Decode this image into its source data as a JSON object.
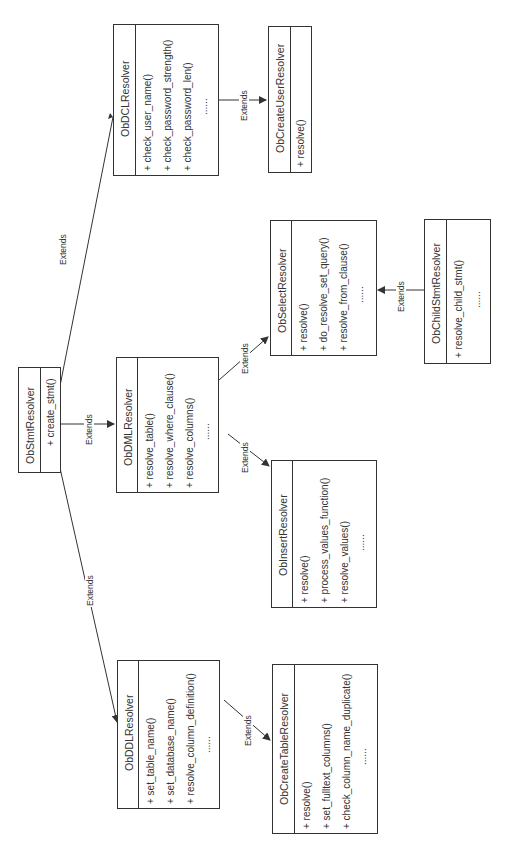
{
  "diagram": {
    "type": "uml-class-hierarchy",
    "orientation": "rotated-90-ccw",
    "edge_label": "Extends",
    "classes": {
      "stmt": {
        "name": "ObStmtResolver",
        "methods": [
          "+ create_stmt()"
        ]
      },
      "ddl": {
        "name": "ObDDLResolver",
        "methods": [
          "+ set_table_name()",
          "+ set_database_name()",
          "+ resolve_column_definition()",
          "......"
        ]
      },
      "dml": {
        "name": "ObDMLResolver",
        "methods": [
          "+ resolve_table()",
          "+ resolve_where_clause()",
          "+ resolve_columns()",
          "......"
        ]
      },
      "dcl": {
        "name": "ObDCLResolver",
        "methods": [
          "+ check_user_name()",
          "+ check_password_strength()",
          "+ check_password_len()",
          "......"
        ]
      },
      "create_table": {
        "name": "ObCreateTableResolver",
        "methods": [
          "+ resolve()",
          "+ set_fulltext_columns()",
          "+ check_column_name_duplicate()",
          "......"
        ]
      },
      "insert": {
        "name": "ObInsertResolver",
        "methods": [
          "+ resolve()",
          "+ process_values_function()",
          "+ resolve_values()",
          "......"
        ]
      },
      "select": {
        "name": "ObSelectResolver",
        "methods": [
          "+ resolve()",
          "+ do_resolve_set_query()",
          "+ resolve_from_clause()",
          "......"
        ]
      },
      "child_stmt": {
        "name": "ObChildStmtResolver",
        "methods": [
          "+ resolve_child_stmt()",
          "......"
        ]
      },
      "create_user": {
        "name": "ObCreateUserResolver",
        "methods": [
          "+ resolve()"
        ]
      }
    },
    "relations": [
      {
        "from": "ObDDLResolver",
        "to": "ObStmtResolver",
        "label": "Extends"
      },
      {
        "from": "ObDMLResolver",
        "to": "ObStmtResolver",
        "label": "Extends"
      },
      {
        "from": "ObDCLResolver",
        "to": "ObStmtResolver",
        "label": "Extends"
      },
      {
        "from": "ObCreateTableResolver",
        "to": "ObDDLResolver",
        "label": "Extends"
      },
      {
        "from": "ObInsertResolver",
        "to": "ObDMLResolver",
        "label": "Extends"
      },
      {
        "from": "ObSelectResolver",
        "to": "ObDMLResolver",
        "label": "Extends"
      },
      {
        "from": "ObChildStmtResolver",
        "to": "ObSelectResolver",
        "label": "Extends"
      },
      {
        "from": "ObCreateUserResolver",
        "to": "ObDCLResolver",
        "label": "Extends"
      }
    ],
    "colors": {
      "line": "#333333",
      "background": "#ffffff",
      "text": "#333333"
    }
  }
}
